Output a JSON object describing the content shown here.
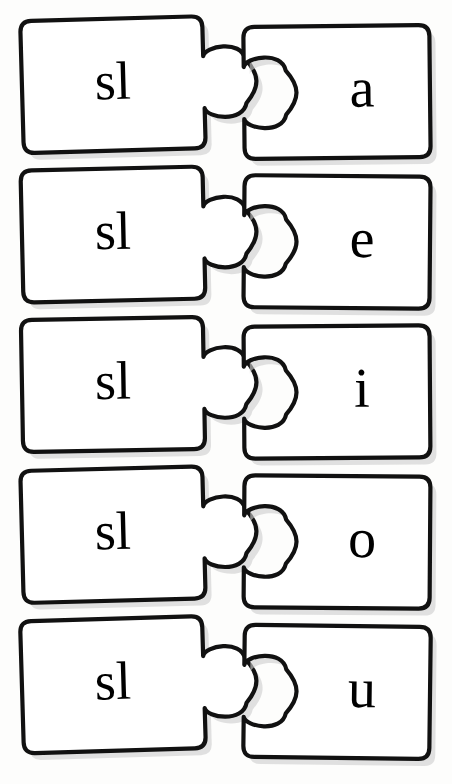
{
  "worksheet": {
    "type": "jigsaw-word-building",
    "background_color": "#fdfdfc",
    "outline_color": "#111111",
    "piece_fill_color": "#ffffff",
    "shadow_color": "#cfcfcf",
    "text_color": "#000000",
    "row_count": 5,
    "columns": 2
  },
  "rows": [
    {
      "index": 1,
      "left_label": "sl",
      "right_label": "a",
      "word": "sla",
      "left_rotation_deg": -1.6,
      "right_rotation_deg": -0.6,
      "top": 6
    },
    {
      "index": 2,
      "left_label": "sl",
      "right_label": "e",
      "word": "sle",
      "left_rotation_deg": -1.3,
      "right_rotation_deg": 0.5,
      "top": 156
    },
    {
      "index": 3,
      "left_label": "sl",
      "right_label": "i",
      "word": "sli",
      "left_rotation_deg": -1.0,
      "right_rotation_deg": -0.4,
      "top": 306
    },
    {
      "index": 4,
      "left_label": "sl",
      "right_label": "o",
      "word": "slo",
      "left_rotation_deg": -1.5,
      "right_rotation_deg": 0.4,
      "top": 456
    },
    {
      "index": 5,
      "left_label": "sl",
      "right_label": "u",
      "word": "slu",
      "left_rotation_deg": -1.7,
      "right_rotation_deg": 0.7,
      "top": 606
    }
  ]
}
